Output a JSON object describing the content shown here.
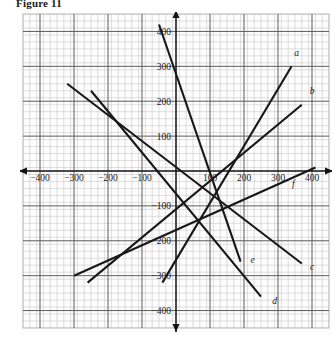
{
  "figure": {
    "title": "Figure 11"
  },
  "axes": {
    "x_axis_label_right": "x",
    "x_axis_label_left": "x",
    "y_axis_label_top": "y",
    "y_axis_label_bottom": "y",
    "x_negative_prefix": "−",
    "x_ticks": [
      "−400",
      "−300",
      "−200",
      "−100",
      "100",
      "200",
      "300",
      "400"
    ],
    "y_ticks": [
      "400",
      "300",
      "200",
      "100",
      "−100",
      "−200",
      "−300",
      "−400"
    ],
    "neg_y_label": "−y",
    "neg_x_label": "−x"
  },
  "grid": {
    "minor_step": 20,
    "major_step": 100,
    "x_min": -450,
    "x_max": 450,
    "y_min": -450,
    "y_max": 450,
    "minor_color": "#b9b9b9",
    "major_color": "#4a4a4a",
    "axis_color": "#111111"
  },
  "chart_data": {
    "type": "line",
    "title": "Figure 11",
    "xlabel": "x",
    "ylabel": "y",
    "xlim": [
      -450,
      450
    ],
    "ylim": [
      -450,
      450
    ],
    "grid": true,
    "legend": "inline-end-labels",
    "series": [
      {
        "name": "a",
        "label": "a",
        "label_point": [
          355,
          330
        ],
        "x": [
          -40,
          340
        ],
        "y": [
          -320,
          300
        ],
        "slope": 1.63,
        "intercept": -255
      },
      {
        "name": "b",
        "label": "b",
        "label_point": [
          400,
          220
        ],
        "x": [
          -260,
          370
        ],
        "y": [
          -320,
          190
        ],
        "slope": 0.81,
        "intercept": -110
      },
      {
        "name": "c",
        "label": "c",
        "label_point": [
          400,
          -285
        ],
        "x": [
          -320,
          370
        ],
        "y": [
          250,
          -265
        ],
        "slope": -0.746,
        "intercept": 11
      },
      {
        "name": "d",
        "label": "d",
        "label_point": [
          290,
          -380
        ],
        "x": [
          -250,
          250
        ],
        "y": [
          230,
          -360
        ],
        "slope": -1.18,
        "intercept": -65
      },
      {
        "name": "e",
        "label": "e",
        "label_point": [
          225,
          -265
        ],
        "x": [
          -50,
          190
        ],
        "y": [
          420,
          -260
        ],
        "slope": -2.83,
        "intercept": 278
      },
      {
        "name": "f",
        "label": "f",
        "label_point": [
          345,
          -45
        ],
        "x": [
          -300,
          410
        ],
        "y": [
          -300,
          10
        ],
        "slope": 0.437,
        "intercept": -169
      }
    ]
  },
  "series_labels": {
    "a": "a",
    "b": "b",
    "c": "c",
    "d": "d",
    "e": "e",
    "f": "f"
  }
}
